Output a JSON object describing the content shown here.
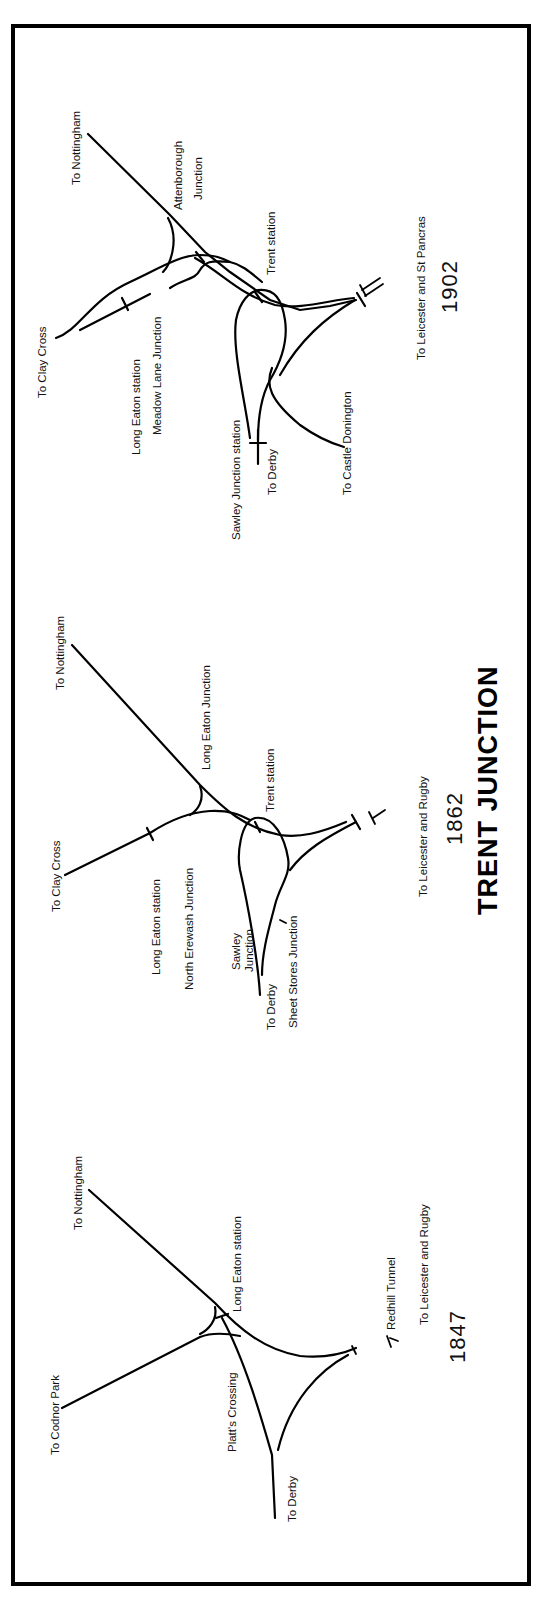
{
  "title": "TRENT JUNCTION",
  "panels": [
    {
      "year": "1902",
      "labels": {
        "to_nottingham": "To Nottingham",
        "attenborough_junction_1": "Attenborough",
        "attenborough_junction_2": "Junction",
        "trent_station": "Trent  station",
        "to_leicester": "To Leicester and St Pancras",
        "to_clay_cross": "To Clay Cross",
        "long_eaton_station": "Long Eaton  station",
        "meadow_lane_junction": "Meadow Lane Junction",
        "sawley_junction_station": "Sawley  Junction  station",
        "to_derby": "To Derby",
        "to_castle_donington": "To Castle Donington"
      }
    },
    {
      "year": "1862",
      "labels": {
        "to_nottingham": "To Nottingham",
        "long_eaton_junction": "Long Eaton Junction",
        "trent_station": "Trent  station",
        "to_leicester": "To Leicester and Rugby",
        "to_clay_cross": "To Clay Cross",
        "long_eaton_station": "Long  Eaton  station",
        "north_erewash_junction": "North  Erewash  Junction",
        "sawley_junction_1": "Sawley",
        "sawley_junction_2": "Junction",
        "to_derby": "To Derby",
        "sheet_stores_junction": "Sheet  Stores  Junction"
      }
    },
    {
      "year": "1847",
      "labels": {
        "to_nottingham": "To  Nottingham",
        "long_eaton_station": "Long  Eaton  station",
        "redhill_tunnel": "Redhill  Tunnel",
        "to_leicester": "To Leicester and Rugby",
        "to_codnor_park": "To Codnor Park",
        "platts_crossing": "Platt's  Crossing",
        "to_derby": "To Derby"
      }
    }
  ]
}
